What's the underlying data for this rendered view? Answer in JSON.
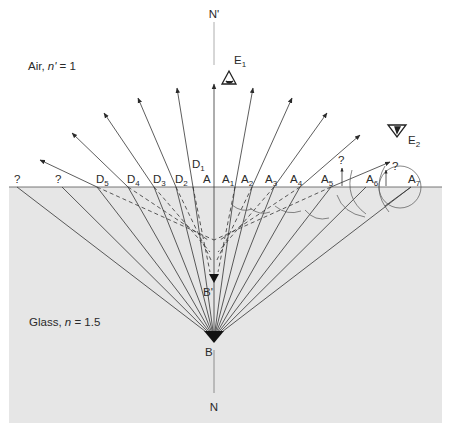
{
  "diagram": {
    "colors": {
      "glass_fill": "#e6e6e6",
      "line": "#333333",
      "normal_line": "#888888",
      "background": "#ffffff"
    },
    "regions": {
      "air_label": "Air, n' = 1",
      "air_label_parts": {
        "name": "Air, ",
        "symbol": "n'",
        "value": " = 1"
      },
      "glass_label": "Glass, n = 1.5",
      "glass_label_parts": {
        "name": "Glass, ",
        "symbol": "n",
        "value": " = 1.5"
      }
    },
    "points": {
      "object": {
        "label": "B",
        "x": 214,
        "y": 338
      },
      "image": {
        "label": "B'",
        "x": 214,
        "y": 281
      },
      "normal_top": {
        "label": "N'"
      },
      "normal_bottom": {
        "label": "N"
      }
    },
    "observers": [
      {
        "label": "E",
        "subscript": "1",
        "name": "eye-1"
      },
      {
        "label": "E",
        "subscript": "2",
        "name": "eye-2"
      }
    ],
    "surface_points_left": [
      {
        "label": "A",
        "subscript": ""
      },
      {
        "label": "D",
        "subscript": "1"
      },
      {
        "label": "D",
        "subscript": "2"
      },
      {
        "label": "D",
        "subscript": "3"
      },
      {
        "label": "D",
        "subscript": "4"
      },
      {
        "label": "D",
        "subscript": "5"
      },
      {
        "label": "?",
        "subscript": ""
      },
      {
        "label": "?",
        "subscript": ""
      }
    ],
    "surface_points_right": [
      {
        "label": "A",
        "subscript": "1"
      },
      {
        "label": "A",
        "subscript": "2"
      },
      {
        "label": "A",
        "subscript": "3"
      },
      {
        "label": "A",
        "subscript": "4"
      },
      {
        "label": "A",
        "subscript": "5"
      },
      {
        "label": "A",
        "subscript": "6"
      },
      {
        "label": "A",
        "subscript": "7"
      }
    ],
    "question_marks_right": [
      "?",
      "?"
    ]
  }
}
